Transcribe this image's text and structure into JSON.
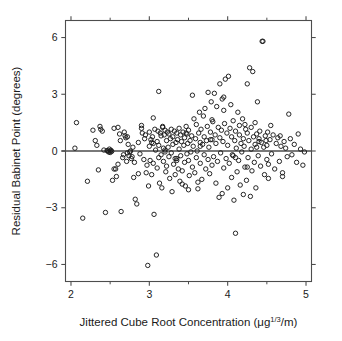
{
  "figure": {
    "background": "#ffffff",
    "frame_color": "#4d4d4d",
    "point_color": "#1a1a1a",
    "refline_color": "#4d4d4d"
  },
  "axes": {
    "x_label": "Jittered Cube Root Concentration (μg⅓/m)",
    "x_label_parts": {
      "prefix": "Jittered Cube Root Concentration (μg",
      "superscript": "1/3",
      "suffix": "/m)"
    },
    "y_label": "Residual Babinet Point (degrees)",
    "x_tick_labels": [
      "2",
      "3",
      "4",
      "5"
    ],
    "y_tick_labels": [
      "6",
      "3",
      "0",
      "−3",
      "−6"
    ],
    "x_major_ticks": [
      2,
      3,
      4,
      5
    ],
    "x_minor_ticks": [
      2.5,
      3.5,
      4.5
    ],
    "y_ticks": [
      6,
      3,
      0,
      -3,
      -6
    ],
    "xlim": [
      1.93,
      5.07
    ],
    "ylim": [
      -6.9,
      6.9
    ],
    "tick_direction": "out",
    "grid": false
  },
  "chart_data": {
    "type": "scatter",
    "title": "",
    "xlabel": "Jittered Cube Root Concentration (μg⅓/m)",
    "ylabel": "Residual Babinet Point (degrees)",
    "xlim": [
      1.93,
      5.07
    ],
    "ylim": [
      -6.9,
      6.9
    ],
    "grid": false,
    "legend": null,
    "marker": "open-circle",
    "marker_size_px": 4.4,
    "reference_line": {
      "type": "horizontal",
      "y": 0,
      "label": ""
    },
    "x": [
      2.05,
      2.07,
      2.15,
      2.21,
      2.28,
      2.31,
      2.33,
      2.35,
      2.37,
      2.4,
      2.42,
      2.44,
      2.46,
      2.47,
      2.48,
      2.49,
      2.5,
      2.5,
      2.51,
      2.52,
      2.53,
      2.55,
      2.57,
      2.58,
      2.6,
      2.62,
      2.63,
      2.64,
      2.66,
      2.67,
      2.68,
      2.69,
      2.7,
      2.71,
      2.72,
      2.73,
      2.74,
      2.75,
      2.76,
      2.77,
      2.78,
      2.79,
      2.8,
      2.81,
      2.82,
      2.84,
      2.86,
      2.88,
      2.9,
      2.91,
      2.93,
      2.94,
      2.95,
      2.96,
      2.97,
      2.98,
      2.99,
      3.0,
      3.0,
      3.01,
      3.02,
      3.03,
      3.04,
      3.05,
      3.05,
      3.06,
      3.07,
      3.08,
      3.09,
      3.1,
      3.1,
      3.11,
      3.12,
      3.12,
      3.13,
      3.14,
      3.15,
      3.15,
      3.16,
      3.17,
      3.18,
      3.18,
      3.19,
      3.2,
      3.2,
      3.21,
      3.22,
      3.22,
      3.23,
      3.24,
      3.25,
      3.25,
      3.26,
      3.27,
      3.28,
      3.28,
      3.29,
      3.3,
      3.3,
      3.31,
      3.32,
      3.33,
      3.34,
      3.35,
      3.35,
      3.36,
      3.37,
      3.38,
      3.38,
      3.39,
      3.4,
      3.4,
      3.41,
      3.42,
      3.43,
      3.44,
      3.45,
      3.45,
      3.46,
      3.47,
      3.48,
      3.48,
      3.49,
      3.5,
      3.5,
      3.51,
      3.52,
      3.53,
      3.54,
      3.55,
      3.55,
      3.56,
      3.57,
      3.58,
      3.59,
      3.6,
      3.6,
      3.61,
      3.62,
      3.63,
      3.64,
      3.65,
      3.65,
      3.66,
      3.67,
      3.68,
      3.69,
      3.7,
      3.7,
      3.71,
      3.72,
      3.73,
      3.74,
      3.75,
      3.75,
      3.76,
      3.77,
      3.78,
      3.79,
      3.8,
      3.8,
      3.81,
      3.82,
      3.83,
      3.84,
      3.85,
      3.85,
      3.86,
      3.87,
      3.88,
      3.89,
      3.9,
      3.9,
      3.91,
      3.92,
      3.93,
      3.94,
      3.95,
      3.95,
      3.96,
      3.97,
      3.98,
      3.99,
      4.0,
      4.0,
      4.01,
      4.02,
      4.03,
      4.04,
      4.05,
      4.05,
      4.06,
      4.07,
      4.08,
      4.09,
      4.1,
      4.1,
      4.11,
      4.12,
      4.13,
      4.14,
      4.15,
      4.15,
      4.16,
      4.17,
      4.18,
      4.19,
      4.2,
      4.2,
      4.21,
      4.22,
      4.23,
      4.24,
      4.25,
      4.25,
      4.26,
      4.27,
      4.28,
      4.29,
      4.3,
      4.3,
      4.31,
      4.32,
      4.33,
      4.34,
      4.35,
      4.35,
      4.36,
      4.37,
      4.38,
      4.39,
      4.4,
      4.41,
      4.42,
      4.43,
      4.44,
      4.45,
      4.46,
      4.47,
      4.48,
      4.49,
      4.5,
      4.5,
      4.51,
      4.52,
      4.54,
      4.56,
      4.58,
      4.6,
      4.62,
      4.64,
      4.66,
      4.68,
      4.7,
      4.72,
      4.74,
      4.76,
      4.78,
      4.8,
      4.82,
      4.85,
      4.88,
      4.9,
      4.93,
      4.96,
      4.98,
      2.38,
      2.55,
      2.72,
      2.86,
      3.03,
      3.17,
      3.33,
      3.47,
      3.62,
      3.78,
      3.93,
      4.07,
      4.22,
      4.37,
      4.52,
      4.67,
      2.6,
      2.9,
      3.2,
      3.5,
      3.8,
      4.1,
      4.4,
      4.7,
      3.05,
      3.35,
      3.65,
      3.95,
      4.25,
      4.55,
      3.12,
      3.42
    ],
    "y": [
      0.15,
      1.5,
      -3.55,
      -1.6,
      1.1,
      0.55,
      0.3,
      -1.0,
      1.3,
      1.05,
      0.05,
      -3.25,
      0.02,
      0.0,
      -0.05,
      0.1,
      0.0,
      -0.08,
      0.04,
      -0.02,
      -1.55,
      1.2,
      -0.95,
      -1.35,
      1.25,
      0.9,
      0.55,
      -3.2,
      -0.35,
      -0.2,
      1.0,
      0.8,
      0.7,
      -0.55,
      -0.1,
      0.35,
      -0.25,
      -0.05,
      0.0,
      -0.4,
      -0.3,
      0.2,
      -1.4,
      -0.6,
      -2.55,
      -2.8,
      0.45,
      -0.15,
      1.35,
      0.95,
      -0.45,
      0.65,
      0.85,
      -1.15,
      -0.75,
      -6.05,
      -1.85,
      1.0,
      0.25,
      -0.5,
      0.6,
      -1.25,
      0.75,
      -0.65,
      0.4,
      -3.35,
      1.15,
      0.05,
      -5.5,
      -0.9,
      0.5,
      1.05,
      -0.35,
      0.3,
      -1.7,
      0.95,
      -0.2,
      0.8,
      -1.95,
      1.25,
      0.15,
      -0.55,
      0.85,
      1.1,
      -0.05,
      -1.1,
      0.55,
      -0.8,
      1.0,
      0.2,
      -0.3,
      0.9,
      -1.45,
      0.65,
      1.15,
      -0.1,
      -2.15,
      0.75,
      0.35,
      -0.7,
      1.05,
      -1.25,
      0.45,
      0.95,
      -0.4,
      0.6,
      -0.95,
      1.2,
      0.1,
      -1.6,
      0.85,
      -0.25,
      0.5,
      -1.05,
      1.0,
      0.3,
      -0.6,
      0.7,
      -1.85,
      1.3,
      -0.15,
      0.9,
      0.4,
      -0.5,
      1.1,
      -1.3,
      0.55,
      -0.05,
      0.8,
      2.95,
      -0.85,
      0.25,
      1.7,
      -1.15,
      0.65,
      -0.35,
      1.4,
      0.0,
      -2.0,
      0.95,
      2.05,
      -0.65,
      0.45,
      1.15,
      -1.5,
      0.35,
      1.85,
      -0.2,
      0.75,
      2.25,
      -0.95,
      0.55,
      1.3,
      -0.45,
      3.1,
      0.2,
      -1.2,
      1.0,
      2.6,
      -0.75,
      0.6,
      1.55,
      -0.3,
      3.05,
      0.85,
      -1.7,
      0.4,
      2.35,
      -0.55,
      1.25,
      -2.45,
      0.7,
      3.55,
      -0.1,
      1.1,
      -2.25,
      0.5,
      2.15,
      -0.9,
      1.45,
      3.8,
      -0.4,
      0.95,
      -1.95,
      0.3,
      3.95,
      -0.65,
      1.2,
      2.45,
      -1.4,
      0.75,
      -0.2,
      1.6,
      -2.6,
      0.55,
      -4.35,
      1.05,
      0.15,
      -1.1,
      2.05,
      -0.5,
      0.85,
      1.35,
      -1.8,
      0.4,
      -0.05,
      1.7,
      -2.3,
      0.65,
      0.25,
      -0.85,
      1.15,
      -1.55,
      0.95,
      3.55,
      -0.35,
      0.55,
      4.4,
      -2.4,
      1.25,
      0.1,
      -1.05,
      4.2,
      0.75,
      -0.6,
      1.5,
      0.35,
      -1.95,
      0.9,
      2.6,
      -0.25,
      0.65,
      1.05,
      -0.8,
      0.45,
      5.8,
      5.8,
      0.2,
      -1.25,
      0.8,
      0.55,
      -0.45,
      0.3,
      1.0,
      -0.7,
      0.6,
      -0.15,
      0.85,
      -0.95,
      0.4,
      0.7,
      -0.55,
      0.25,
      -1.35,
      0.5,
      0.15,
      -0.3,
      1.95,
      0.65,
      -0.2,
      0.35,
      -0.6,
      0.9,
      0.1,
      -0.75,
      -0.05,
      1.15,
      -0.95,
      0.75,
      -1.2,
      0.45,
      1.3,
      -0.4,
      0.95,
      -1.65,
      0.6,
      2.75,
      -0.25,
      1.4,
      0.2,
      -1.45,
      0.8,
      -0.7,
      1.2,
      0.05,
      -2.05,
      1.65,
      -0.35,
      0.5,
      -1.15,
      1.75,
      -0.5,
      0.25,
      2.85,
      -0.85,
      1.35,
      3.15,
      -1.75
    ],
    "n_points": 302
  }
}
